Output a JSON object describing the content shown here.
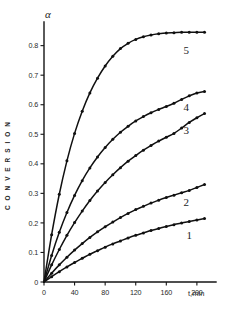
{
  "figure": {
    "y_axis_symbol": "α",
    "y_axis_title": "C O N V E R S I O N",
    "x_axis_title": "t,min"
  },
  "chart_data": {
    "type": "line",
    "title": "",
    "subtitle": "",
    "xlabel": "t,min",
    "ylabel": "CONVERSION",
    "y_axis_symbol": "α",
    "xlim": [
      0,
      225
    ],
    "ylim": [
      0,
      0.88
    ],
    "grid": false,
    "legend_position": "inline-right",
    "xticks": [
      0,
      40,
      80,
      120,
      160,
      200
    ],
    "xtick_labels": [
      "0",
      "40",
      "80",
      "120",
      "160",
      "200"
    ],
    "yticks": [
      0,
      0.1,
      0.2,
      0.3,
      0.4,
      0.5,
      0.6,
      0.7,
      0.8
    ],
    "ytick_labels": [
      "0",
      "0.1",
      "0.2",
      "0.3",
      "0.4",
      "0.5",
      "0.6",
      "0.7",
      "0.8"
    ],
    "markers": "filled-circle",
    "series": [
      {
        "name": "1",
        "label": "1",
        "plateau": 0.215,
        "x": [
          0,
          10,
          20,
          30,
          40,
          50,
          60,
          70,
          80,
          90,
          100,
          110,
          120,
          130,
          140,
          150,
          160,
          170,
          180,
          190,
          200,
          210
        ],
        "values": [
          0.0,
          0.018,
          0.035,
          0.051,
          0.066,
          0.08,
          0.094,
          0.106,
          0.118,
          0.129,
          0.139,
          0.149,
          0.158,
          0.166,
          0.174,
          0.181,
          0.188,
          0.194,
          0.2,
          0.205,
          0.21,
          0.215
        ]
      },
      {
        "name": "2",
        "label": "2",
        "plateau": 0.33,
        "x": [
          0,
          10,
          20,
          30,
          40,
          50,
          60,
          70,
          80,
          90,
          100,
          110,
          120,
          130,
          140,
          150,
          160,
          170,
          180,
          190,
          200,
          210
        ],
        "values": [
          0.0,
          0.03,
          0.058,
          0.084,
          0.108,
          0.13,
          0.151,
          0.17,
          0.187,
          0.203,
          0.218,
          0.232,
          0.245,
          0.256,
          0.267,
          0.277,
          0.286,
          0.294,
          0.302,
          0.31,
          0.32,
          0.33
        ]
      },
      {
        "name": "3",
        "label": "3",
        "plateau": 0.57,
        "x": [
          0,
          10,
          20,
          30,
          40,
          50,
          60,
          70,
          80,
          90,
          100,
          110,
          120,
          130,
          140,
          150,
          160,
          170,
          180,
          190,
          200,
          210
        ],
        "values": [
          0.0,
          0.058,
          0.11,
          0.158,
          0.201,
          0.24,
          0.276,
          0.308,
          0.337,
          0.363,
          0.387,
          0.409,
          0.428,
          0.446,
          0.462,
          0.477,
          0.49,
          0.503,
          0.521,
          0.54,
          0.556,
          0.57
        ]
      },
      {
        "name": "4",
        "label": "4",
        "plateau": 0.645,
        "x": [
          0,
          10,
          20,
          30,
          40,
          50,
          60,
          70,
          80,
          90,
          100,
          110,
          120,
          130,
          140,
          150,
          160,
          170,
          180,
          190,
          200,
          210
        ],
        "values": [
          0.0,
          0.09,
          0.168,
          0.235,
          0.293,
          0.343,
          0.386,
          0.423,
          0.455,
          0.483,
          0.507,
          0.527,
          0.545,
          0.56,
          0.573,
          0.584,
          0.594,
          0.605,
          0.618,
          0.63,
          0.64,
          0.645
        ]
      },
      {
        "name": "5",
        "label": "5",
        "plateau": 0.845,
        "x": [
          0,
          10,
          20,
          30,
          40,
          50,
          60,
          70,
          80,
          90,
          100,
          110,
          120,
          130,
          140,
          150,
          160,
          170,
          180,
          190,
          200,
          210
        ],
        "values": [
          0.0,
          0.16,
          0.297,
          0.41,
          0.503,
          0.578,
          0.64,
          0.69,
          0.731,
          0.764,
          0.79,
          0.808,
          0.821,
          0.83,
          0.836,
          0.84,
          0.843,
          0.844,
          0.845,
          0.845,
          0.845,
          0.845
        ]
      }
    ],
    "series_label_positions": [
      {
        "name": "1",
        "x": 190,
        "y": 0.145
      },
      {
        "name": "2",
        "x": 186,
        "y": 0.258
      },
      {
        "name": "3",
        "x": 186,
        "y": 0.5
      },
      {
        "name": "4",
        "x": 186,
        "y": 0.578
      },
      {
        "name": "5",
        "x": 186,
        "y": 0.772
      }
    ]
  }
}
